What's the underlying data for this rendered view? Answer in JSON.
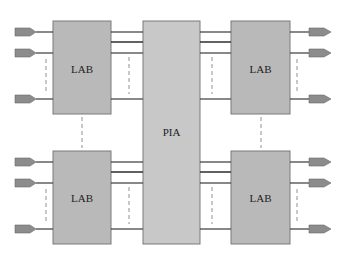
{
  "diagram": {
    "type": "block-diagram",
    "colors": {
      "block_fill": "#b9b9b9",
      "pia_fill": "#c8c8c8",
      "block_stroke": "#7a7a7a",
      "pin_fill": "#8c8c8c",
      "line": "#3a3a3a",
      "dashed": "#777777"
    },
    "blocks": [
      {
        "id": "lab-top-left",
        "label": "LAB"
      },
      {
        "id": "lab-bottom-left",
        "label": "LAB"
      },
      {
        "id": "pia",
        "label": "PIA"
      },
      {
        "id": "lab-top-right",
        "label": "LAB"
      },
      {
        "id": "lab-bottom-right",
        "label": "LAB"
      }
    ],
    "io_pins_per_lab": 3,
    "bus_lines_per_lab": 4
  }
}
